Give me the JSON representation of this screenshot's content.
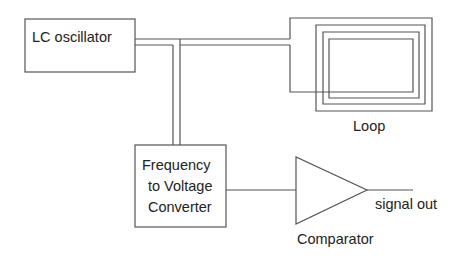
{
  "diagram": {
    "blocks": {
      "oscillator": {
        "label": "LC oscillator"
      },
      "converter": {
        "lines": [
          "Frequency",
          "to Voltage",
          "Converter"
        ]
      },
      "loop": {
        "label": "Loop"
      },
      "comparator": {
        "label": "Comparator"
      }
    },
    "output": {
      "label": "signal out"
    },
    "colors": {
      "line": "#555555",
      "text": "#222222",
      "background": "#ffffff"
    }
  }
}
